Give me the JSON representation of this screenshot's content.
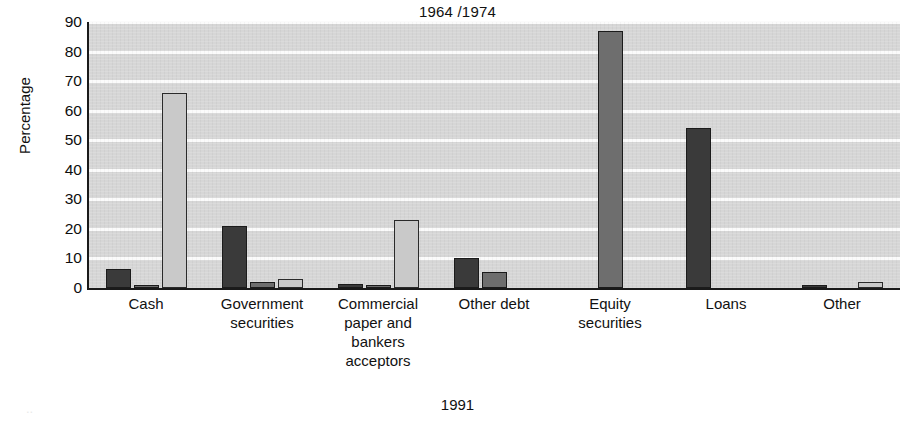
{
  "chart_data": {
    "type": "bar",
    "title": "1964 /1974",
    "footer_label": "1991",
    "xlabel": "",
    "ylabel": "Percentage",
    "ylim": [
      0,
      90
    ],
    "ytick_step": 10,
    "yticks": [
      "90",
      "80",
      "70",
      "60",
      "50",
      "40",
      "30",
      "20",
      "10",
      "0"
    ],
    "grid": true,
    "grid_axis": "y",
    "legend": "none",
    "categories": [
      "Cash",
      "Government securities",
      "Commercial paper and bankers acceptors",
      "Other debt",
      "Equity securities",
      "Loans",
      "Other"
    ],
    "category_label_lines": [
      [
        "Cash"
      ],
      [
        "Government",
        "securities"
      ],
      [
        "Commercial",
        "paper and",
        "bankers",
        "acceptors"
      ],
      [
        "Other debt"
      ],
      [
        "Equity",
        "securities"
      ],
      [
        "Loans"
      ],
      [
        "Other"
      ]
    ],
    "series": [
      {
        "name": "1964",
        "color": "#3a3a3a",
        "values": [
          6.5,
          21,
          1.5,
          10,
          0,
          54,
          0.7
        ]
      },
      {
        "name": "1974",
        "color": "#6e6e6e",
        "values": [
          1,
          2,
          1,
          5.5,
          87,
          0,
          0
        ]
      },
      {
        "name": "1991",
        "color": "#c9c9c9",
        "values": [
          66,
          3,
          23,
          0,
          0,
          0,
          2
        ]
      }
    ]
  },
  "style": {
    "plot_background": "#d6d6d6",
    "gridline_color": "#fbfbfb",
    "axis_color": "#1a1a1a",
    "page_background": "#ffffff"
  }
}
